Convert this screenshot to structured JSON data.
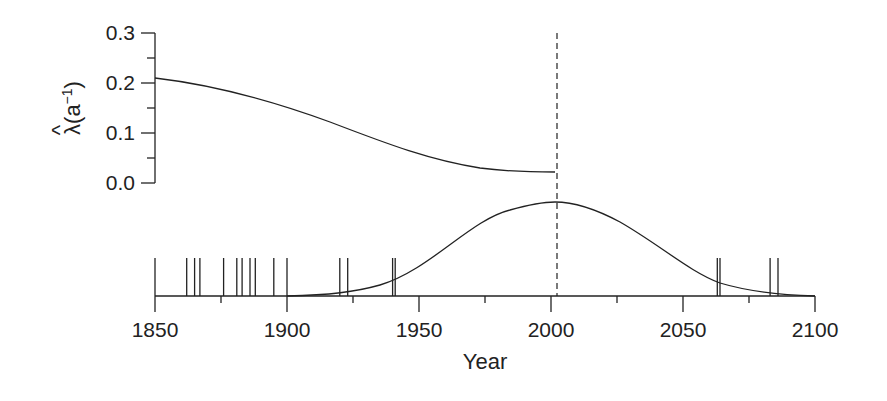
{
  "chart_data": [
    {
      "type": "line",
      "title": "",
      "xlabel": "",
      "ylabel": "λ̂(a⁻¹)",
      "ylabel_parts": {
        "hat": "^",
        "symbol": "λ",
        "unit": "(a",
        "exp": "−1",
        "close": ")"
      },
      "ylim": [
        0.0,
        0.3
      ],
      "yticks": [
        "0.0",
        "0.1",
        "0.2",
        "0.3"
      ],
      "xlim": [
        1850,
        2003
      ],
      "grid": false,
      "series": [
        {
          "name": "estimated rate",
          "x": [
            1850,
            1875,
            1900,
            1925,
            1950,
            1975,
            2003
          ],
          "y": [
            0.21,
            0.19,
            0.16,
            0.12,
            0.08,
            0.04,
            0.02
          ]
        }
      ]
    },
    {
      "type": "line",
      "title": "",
      "xlabel": "Year",
      "ylabel": "",
      "xlim": [
        1850,
        2100
      ],
      "xticks": [
        "1850",
        "1900",
        "1950",
        "2000",
        "2050",
        "2100"
      ],
      "grid": false,
      "series": [
        {
          "name": "density curve",
          "x": [
            1900,
            1925,
            1950,
            1975,
            2003,
            2025,
            2050,
            2075,
            2100
          ],
          "y": [
            0.0,
            0.04,
            0.22,
            0.66,
            1.0,
            0.74,
            0.28,
            0.04,
            0.0
          ]
        }
      ],
      "event_years": [
        1850,
        1862,
        1865,
        1867,
        1876,
        1881,
        1883,
        1886,
        1888,
        1895,
        1900,
        1920,
        1923,
        1940,
        1941,
        2063,
        2064,
        2083,
        2086
      ],
      "annotations": [
        {
          "type": "vertical-dashed-line",
          "x": 2003
        }
      ]
    }
  ]
}
